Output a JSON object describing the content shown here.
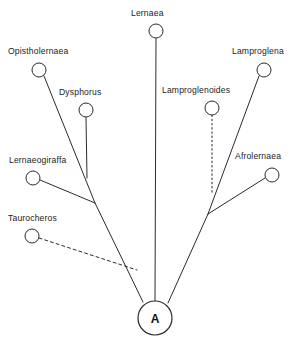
{
  "diagram": {
    "type": "cladogram",
    "title": "",
    "background_color": "#ffffff",
    "line_color": "#2b2b2b",
    "node_fill": "#ffffff",
    "root": {
      "label": "A",
      "cx": 155,
      "cy": 318,
      "r": 17
    },
    "taxa": [
      {
        "name": "Lernaea",
        "label": "Lernaea",
        "cx": 156,
        "cy": 31,
        "r": 7,
        "label_x": 131,
        "label_y": 16,
        "line_style": "solid",
        "connects_to": "root"
      },
      {
        "name": "Opistholernaea",
        "label": "Opistholernaea",
        "cx": 39,
        "cy": 70,
        "r": 7,
        "label_x": 8,
        "label_y": 54,
        "line_style": "solid",
        "connects_to": "left-clade"
      },
      {
        "name": "Dysphorus",
        "label": "Dysphorus",
        "cx": 86,
        "cy": 110,
        "r": 7,
        "label_x": 59,
        "label_y": 95,
        "line_style": "solid",
        "connects_to": "opistholernaea-branch"
      },
      {
        "name": "Lernaeogiraffa",
        "label": "Lernaeogiraffa",
        "cx": 33,
        "cy": 178,
        "r": 7,
        "label_x": 9,
        "label_y": 163,
        "line_style": "solid",
        "connects_to": "left-node"
      },
      {
        "name": "Taurocheros",
        "label": "Taurocheros",
        "cx": 32,
        "cy": 236,
        "r": 7,
        "label_x": 8,
        "label_y": 221,
        "line_style": "dashed",
        "connects_to": "left-branch"
      },
      {
        "name": "Lamproglenoides",
        "label": "Lamproglenoides",
        "cx": 212,
        "cy": 108,
        "r": 7,
        "label_x": 162,
        "label_y": 93,
        "line_style": "dotted",
        "connects_to": "lamproglena-branch"
      },
      {
        "name": "Lamproglena",
        "label": "Lamproglena",
        "cx": 264,
        "cy": 70,
        "r": 7,
        "label_x": 232,
        "label_y": 54,
        "line_style": "solid",
        "connects_to": "right-node"
      },
      {
        "name": "Afrolernaea",
        "label": "Afrolernaea",
        "cx": 272,
        "cy": 175,
        "r": 7,
        "label_x": 235,
        "label_y": 159,
        "line_style": "solid",
        "connects_to": "right-node"
      }
    ],
    "internal_nodes": [
      {
        "name": "left-node",
        "x": 95,
        "y": 203
      },
      {
        "name": "right-node",
        "x": 208,
        "y": 214
      },
      {
        "name": "dysphorus-join",
        "x": 86,
        "y": 177
      },
      {
        "name": "lamproglenoides-join",
        "x": 212,
        "y": 193
      },
      {
        "name": "taurocheros-join",
        "x": 137,
        "y": 270
      }
    ]
  }
}
